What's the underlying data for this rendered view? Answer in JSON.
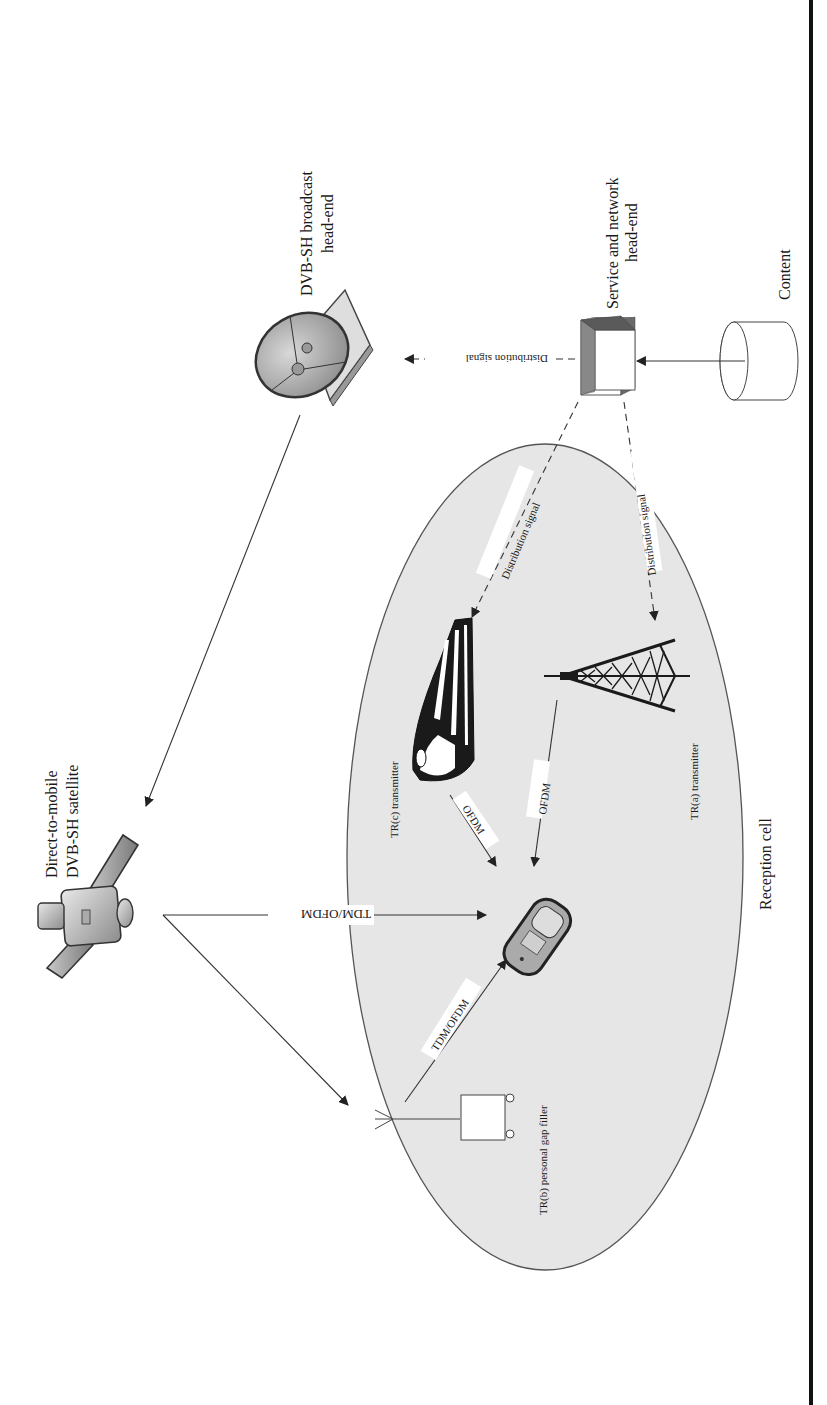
{
  "figure": {
    "orientation": "rotated 90 degrees counterclockwise",
    "nodes": {
      "broadcast_headend": {
        "label_line1": "DVB-SH broadcast",
        "label_line2": "head-end",
        "icon": "satellite-dish-icon"
      },
      "service_headend": {
        "label_line1": "Service and network",
        "label_line2": "head-end",
        "icon": "server-cube-icon"
      },
      "content": {
        "label": "Content",
        "icon": "database-cylinder-icon"
      },
      "satellite": {
        "label_line1": "Direct-to-mobile",
        "label_line2": "DVB-SH satellite",
        "icon": "satellite-icon"
      },
      "tr_c": {
        "label": "TR(c) transmitter",
        "icon": "train-icon"
      },
      "tr_a": {
        "label": "TR(a) transmitter",
        "icon": "transmission-tower-icon"
      },
      "tr_b": {
        "label": "TR(b) personal gap filler",
        "icon": "gap-filler-box-icon"
      },
      "handset": {
        "icon": "mobile-phone-icon"
      },
      "reception_cell": {
        "label": "Reception cell"
      }
    },
    "links": {
      "headend_to_dish": "Distribution signal",
      "service_to_trc": "Distribution signal",
      "service_to_tra": "Distribution signal",
      "sat_to_phone": "TDM/OFDM",
      "trc_to_phone": "OFDM",
      "tra_to_phone": "OFDM",
      "trb_to_phone": "TDM/OFDM"
    },
    "colors": {
      "cell_fill": "#e6e6e6",
      "cell_stroke": "#555555",
      "line": "#333333",
      "rule": "#111111"
    }
  }
}
